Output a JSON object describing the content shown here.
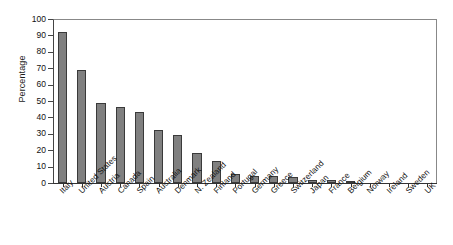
{
  "chart_data": {
    "type": "bar",
    "title": "",
    "xlabel": "",
    "ylabel": "Percentage",
    "ylim": [
      0,
      100
    ],
    "ytick_step": 10,
    "grid": false,
    "legend": "none",
    "bar_color": "#808080",
    "bar_edge_color": "#3a3a3a",
    "yticks": [
      "100",
      "90",
      "80",
      "70",
      "60",
      "50",
      "40",
      "30",
      "20",
      "10",
      "0"
    ],
    "categories": [
      "Italy",
      "United States",
      "Austria",
      "Canada",
      "Spain",
      "Australia",
      "Denmark",
      "N. Zealand",
      "Finland",
      "Portugal",
      "Germany",
      "Greece",
      "Switzerland",
      "Japan",
      "France",
      "Belgium",
      "Norway",
      "Ireland",
      "Sweden",
      "UK"
    ],
    "values": [
      92,
      69,
      49,
      46.5,
      43.5,
      32.5,
      29,
      18.5,
      13.5,
      5.5,
      4.5,
      4.5,
      3.5,
      2,
      2,
      1,
      0,
      0,
      0,
      0
    ]
  }
}
